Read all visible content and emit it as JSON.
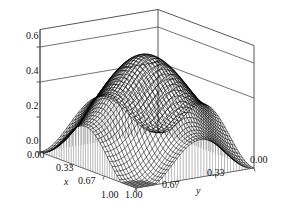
{
  "figure": {
    "type": "3d-surface-mesh",
    "background_color": "#ffffff",
    "mesh_color": "#000000",
    "axis_color": "#555555",
    "box_color": "#444444",
    "curtain_color": "#777777"
  },
  "axes": {
    "z": {
      "label": "",
      "ticks": [
        "0.6",
        "0.4",
        "0.2",
        "0.0"
      ],
      "tick_values": [
        0.6,
        0.4,
        0.2,
        0.0
      ],
      "range": [
        0.0,
        0.7
      ],
      "gridlines_at": [
        0.4,
        0.6
      ]
    },
    "x": {
      "label": "x",
      "ticks": [
        "0.00",
        "0.33",
        "0.67",
        "1.00"
      ],
      "tick_values": [
        0.0,
        0.33,
        0.67,
        1.0
      ],
      "range": [
        0.0,
        1.0
      ]
    },
    "y": {
      "label": "y",
      "ticks": [
        "1.00",
        "0.67",
        "0.33",
        "0.00"
      ],
      "tick_values": [
        1.0,
        0.67,
        0.33,
        0.0
      ],
      "range": [
        0.0,
        1.0
      ]
    }
  },
  "chart_data": {
    "type": "surface",
    "title": "",
    "xlabel": "x",
    "ylabel": "y",
    "zlabel": "",
    "xlim": [
      0.0,
      1.0
    ],
    "ylim": [
      0.0,
      1.0
    ],
    "zlim": [
      0.0,
      0.7
    ],
    "grid": true,
    "legend": "none",
    "mesh_n": 40,
    "surface_description": "Smooth saddle-like surface: a broad diagonal ridge peaking near z=0.52 across the back, falling to a pronounced rounded valley near z=0.00 at the front-center, with edge values near 0.28 at the left corner, 0.19 at the right corner.",
    "z_peak": 0.52,
    "z_min": 0.0,
    "corner_values": {
      "x0_y0": 0.19,
      "x0_y1": 0.28,
      "x1_y0": 0.19,
      "x1_y1": 0.28
    },
    "formula_terms": {
      "amplitude": 0.26,
      "offset": 0.26,
      "kx": 1.0,
      "ky": 1.0
    }
  },
  "projection": {
    "origin_x": 40,
    "origin_y": 152,
    "x_axis_vec": [
      96,
      36
    ],
    "y_axis_vec": [
      118,
      -20
    ],
    "z_scale": 175
  }
}
